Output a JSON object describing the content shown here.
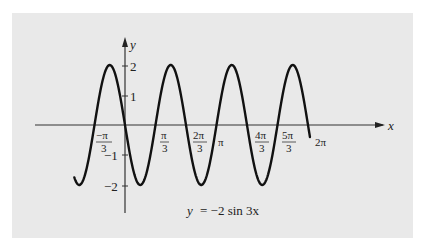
{
  "chart_data": {
    "type": "line",
    "title": "",
    "equation_label": "y = −2 sin 3x",
    "function": "y = -2 sin(3x)",
    "xlabel": "x",
    "ylabel": "y",
    "xlim": [
      -1.65,
      6.35
    ],
    "ylim": [
      -2.85,
      2.8
    ],
    "grid": false,
    "legend": "none",
    "x_ticks": [
      {
        "value": -1.0472,
        "label": "−π/3"
      },
      {
        "value": 1.0472,
        "label": "π/3"
      },
      {
        "value": 2.0944,
        "label": "2π/3"
      },
      {
        "value": 3.1416,
        "label": "π"
      },
      {
        "value": 4.1888,
        "label": "4π/3"
      },
      {
        "value": 5.236,
        "label": "5π/3"
      },
      {
        "value": 6.2832,
        "label": "2π"
      }
    ],
    "y_ticks": [
      {
        "value": 2,
        "label": "2"
      },
      {
        "value": 1,
        "label": "1"
      },
      {
        "value": -1,
        "label": "−1"
      },
      {
        "value": -2,
        "label": "−2"
      }
    ],
    "series": [
      {
        "name": "y = -2 sin 3x",
        "x_range": [
          -1.74,
          6.35
        ],
        "key_points": [
          {
            "x": -1.5708,
            "y": -2
          },
          {
            "x": -1.0472,
            "y": 0
          },
          {
            "x": -0.5236,
            "y": 2
          },
          {
            "x": 0,
            "y": 0
          },
          {
            "x": 0.5236,
            "y": -2
          },
          {
            "x": 1.0472,
            "y": 0
          },
          {
            "x": 1.5708,
            "y": 2
          },
          {
            "x": 2.0944,
            "y": 0
          },
          {
            "x": 2.618,
            "y": -2
          },
          {
            "x": 3.1416,
            "y": 0
          },
          {
            "x": 3.6652,
            "y": 2
          },
          {
            "x": 4.1888,
            "y": 0
          },
          {
            "x": 4.7124,
            "y": -2
          },
          {
            "x": 5.236,
            "y": 0
          },
          {
            "x": 5.7596,
            "y": 2
          },
          {
            "x": 6.2832,
            "y": 0
          }
        ]
      }
    ]
  },
  "labels": {
    "x_axis": "x",
    "y_axis": "y",
    "equation_lhs": "y",
    "equation_rhs": "= −2 sin 3x",
    "tick_neg_pi_3_num": "−π",
    "tick_pi_3_num": "π",
    "tick_2pi_3_num": "2π",
    "tick_pi": "π",
    "tick_4pi_3_num": "4π",
    "tick_5pi_3_num": "5π",
    "tick_den": "3",
    "tick_2pi": "2π",
    "y2": "2",
    "y1": "1",
    "ym1": "−1",
    "ym2": "−2"
  }
}
